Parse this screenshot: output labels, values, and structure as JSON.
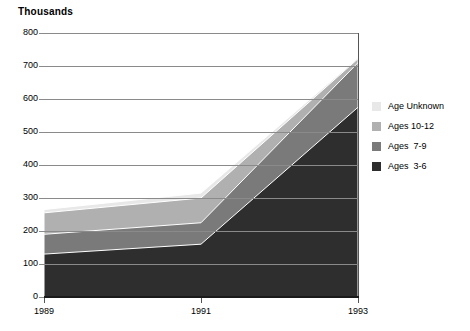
{
  "chart_data": {
    "type": "area",
    "stacked": true,
    "title": "",
    "subtitle": "",
    "unit_title": "Thousands",
    "xlabel": "",
    "ylabel": "Thousands",
    "x": [
      1989,
      1991,
      1993
    ],
    "categories": [
      "1989",
      "1991",
      "1993"
    ],
    "xtick_labels": [
      "1989",
      "1991",
      "1993"
    ],
    "ytick_labels": [
      "800",
      "700",
      "600",
      "500",
      "400",
      "300",
      "200",
      "100",
      "0"
    ],
    "ytick_values": [
      800,
      700,
      600,
      500,
      400,
      300,
      200,
      100,
      0
    ],
    "ylim": [
      0,
      800
    ],
    "xlim": [
      1989,
      1993
    ],
    "grid": "horizontal",
    "legend_position": "right",
    "series": [
      {
        "name": "Age Unknown",
        "color": "#e8e8e8",
        "values": [
          10,
          15,
          3
        ],
        "cumulative_top": [
          265,
          315,
          725
        ]
      },
      {
        "name": "Ages 10-12",
        "color": "#b0b0b0",
        "values": [
          65,
          75,
          12
        ],
        "cumulative_top": [
          255,
          300,
          722
        ]
      },
      {
        "name": "Ages  7-9",
        "color": "#7a7a7a",
        "values": [
          60,
          65,
          135
        ],
        "cumulative_top": [
          190,
          225,
          710
        ]
      },
      {
        "name": "Ages  3-6",
        "color": "#2e2e2e",
        "values": [
          130,
          160,
          575
        ],
        "cumulative_top": [
          130,
          160,
          575
        ]
      }
    ],
    "totals": [
      265,
      315,
      725
    ]
  },
  "legend": {
    "items": [
      {
        "label": "Age Unknown",
        "color": "#e8e8e8"
      },
      {
        "label": "Ages 10-12",
        "color": "#b0b0b0"
      },
      {
        "label": "Ages  7-9",
        "color": "#7a7a7a"
      },
      {
        "label": "Ages  3-6",
        "color": "#2e2e2e"
      }
    ]
  },
  "colors": {
    "gridline": "#8a8a8a",
    "axis": "#1a1a1a",
    "background": "#ffffff",
    "text": "#000000",
    "band_separator": "#ffffff"
  }
}
